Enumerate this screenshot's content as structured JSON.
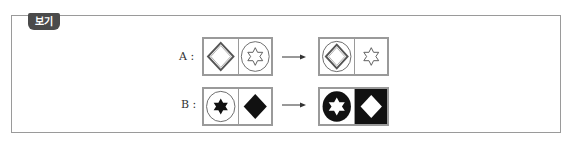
{
  "badge": {
    "label": "보기"
  },
  "rows": [
    {
      "label": "A :",
      "before": [
        {
          "shape": "diamond-outline",
          "container": "square",
          "fill": "white"
        },
        {
          "shape": "hexagram-outline",
          "container": "circle-outline",
          "fill": "white"
        }
      ],
      "after": [
        {
          "shape": "diamond-outline",
          "container": "circle-outline",
          "fill": "white"
        },
        {
          "shape": "hexagram-outline",
          "container": "square",
          "fill": "white"
        }
      ]
    },
    {
      "label": "B :",
      "before": [
        {
          "shape": "hexagram-filled",
          "container": "circle-outline",
          "fill": "white"
        },
        {
          "shape": "diamond-filled",
          "container": "square",
          "fill": "white"
        }
      ],
      "after": [
        {
          "shape": "hexagram-white",
          "container": "circle-filled",
          "fill": "white"
        },
        {
          "shape": "diamond-white",
          "container": "square",
          "fill": "black"
        }
      ]
    }
  ],
  "arrow_icon": "right-arrow-icon",
  "colors": {
    "badge": "#4a4a4a",
    "border": "#9a9a9a",
    "ink": "#111111"
  }
}
